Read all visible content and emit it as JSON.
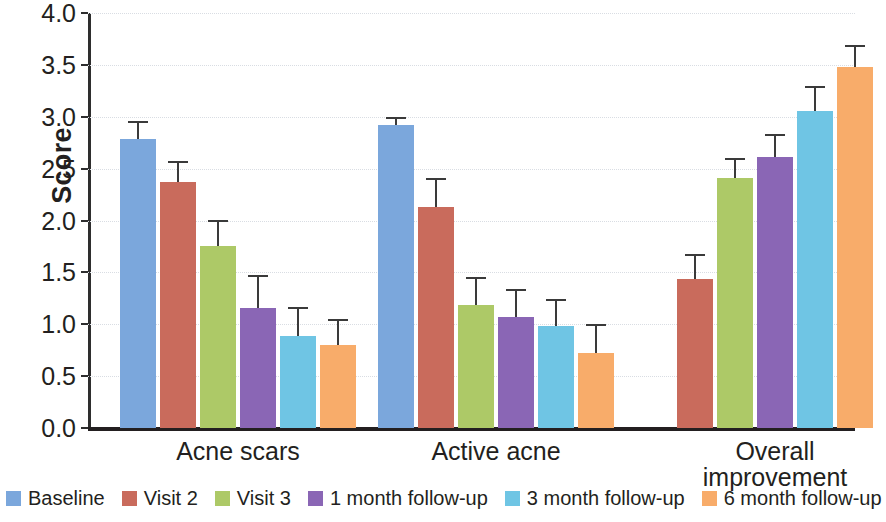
{
  "chart_data": {
    "type": "bar",
    "title": "",
    "xlabel": "",
    "ylabel": "Score",
    "ylim": [
      0,
      4
    ],
    "ytick_step": 0.5,
    "ytick_labels": [
      "0.0",
      "0.5",
      "1.0",
      "1.5",
      "2.0",
      "2.5",
      "3.0",
      "3.5",
      "4.0"
    ],
    "grid": true,
    "legend_position": "bottom",
    "error_bars": true,
    "error_bar_type": "symmetric-cap",
    "categories": [
      "Acne scars",
      "Active acne",
      "Overall improvement"
    ],
    "category_label_lines": [
      [
        "Acne scars"
      ],
      [
        "Active acne"
      ],
      [
        "Overall",
        "improvement"
      ]
    ],
    "series": [
      {
        "name": "Baseline",
        "color": "#7BA7DC",
        "values": [
          2.79,
          2.92,
          null
        ],
        "errors": [
          0.15,
          0.06,
          null
        ]
      },
      {
        "name": "Visit 2",
        "color": "#C96B5C",
        "values": [
          2.37,
          2.13,
          1.44
        ],
        "errors": [
          0.18,
          0.26,
          0.22
        ]
      },
      {
        "name": "Visit 3",
        "color": "#ADC967",
        "values": [
          1.75,
          1.19,
          2.41
        ],
        "errors": [
          0.24,
          0.25,
          0.17
        ]
      },
      {
        "name": "1 month follow-up",
        "color": "#8A66B5",
        "values": [
          1.16,
          1.07,
          2.61
        ],
        "errors": [
          0.3,
          0.25,
          0.2
        ]
      },
      {
        "name": "3 month follow-up",
        "color": "#6FC5E4",
        "values": [
          0.89,
          0.98,
          3.06
        ],
        "errors": [
          0.26,
          0.24,
          0.22
        ]
      },
      {
        "name": "6 month follow-up",
        "color": "#F8AC6A",
        "values": [
          0.8,
          0.72,
          3.48
        ],
        "errors": [
          0.23,
          0.26,
          0.19
        ]
      }
    ]
  },
  "axis": {
    "y_title": "Score"
  }
}
